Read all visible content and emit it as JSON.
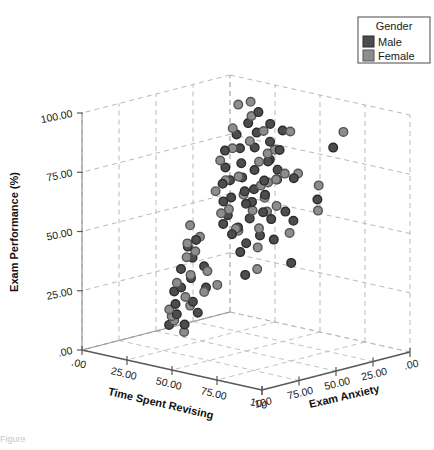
{
  "figure": {
    "caption_partial": "Figure"
  },
  "legend": {
    "title": "Gender",
    "entries": [
      {
        "label": "Male",
        "color": "#4d4d4d"
      },
      {
        "label": "Female",
        "color": "#8d8d8d"
      }
    ]
  },
  "chart_data": {
    "type": "scatter",
    "projection": "3d",
    "title": "",
    "xlabel": "Time Spent Revising",
    "ylabel": "Exam Performance (%)",
    "zlabel": "Exam Anxiety",
    "xlim": [
      0,
      100
    ],
    "ylim": [
      0,
      100
    ],
    "zlim": [
      0,
      100
    ],
    "xticklabels": [
      ".00",
      "25.00",
      "50.00",
      "75.00",
      "100"
    ],
    "xticks": [
      0,
      25,
      50,
      75,
      100
    ],
    "yticklabels": [
      ".00",
      "25.00",
      "50.00",
      "75.00",
      "100.00"
    ],
    "yticks": [
      0,
      25,
      50,
      75,
      100
    ],
    "zticklabels": [
      "100",
      "75.00",
      "50.00",
      "25.00",
      ".00"
    ],
    "zticks": [
      100,
      75,
      50,
      25,
      0
    ],
    "zaxis_reversed": true,
    "grid": true,
    "legend_position": "upper right",
    "series": [
      {
        "name": "Male",
        "color": "#4d4d4d",
        "points": [
          [
            12,
            73,
            18
          ],
          [
            14,
            60,
            22
          ],
          [
            16,
            80,
            15
          ],
          [
            18,
            68,
            25
          ],
          [
            20,
            85,
            12
          ],
          [
            21,
            55,
            30
          ],
          [
            22,
            76,
            20
          ],
          [
            23,
            64,
            28
          ],
          [
            24,
            90,
            10
          ],
          [
            25,
            47,
            35
          ],
          [
            26,
            71,
            24
          ],
          [
            27,
            58,
            32
          ],
          [
            28,
            83,
            16
          ],
          [
            29,
            66,
            27
          ],
          [
            30,
            52,
            38
          ],
          [
            31,
            78,
            21
          ],
          [
            32,
            61,
            29
          ],
          [
            33,
            87,
            13
          ],
          [
            34,
            45,
            40
          ],
          [
            35,
            70,
            26
          ],
          [
            36,
            57,
            33
          ],
          [
            37,
            81,
            18
          ],
          [
            38,
            63,
            30
          ],
          [
            39,
            49,
            42
          ],
          [
            40,
            74,
            23
          ],
          [
            41,
            59,
            35
          ],
          [
            42,
            67,
            28
          ],
          [
            43,
            53,
            39
          ],
          [
            44,
            79,
            20
          ],
          [
            45,
            62,
            31
          ],
          [
            46,
            44,
            45
          ],
          [
            47,
            72,
            25
          ],
          [
            48,
            56,
            36
          ],
          [
            50,
            69,
            29
          ],
          [
            52,
            48,
            43
          ],
          [
            16,
            38,
            48
          ],
          [
            18,
            30,
            55
          ],
          [
            20,
            22,
            62
          ],
          [
            22,
            35,
            52
          ],
          [
            24,
            18,
            66
          ],
          [
            26,
            28,
            58
          ],
          [
            28,
            15,
            70
          ],
          [
            30,
            33,
            54
          ],
          [
            32,
            20,
            64
          ],
          [
            34,
            12,
            72
          ],
          [
            36,
            26,
            60
          ],
          [
            38,
            17,
            68
          ],
          [
            19,
            41,
            46
          ],
          [
            23,
            24,
            61
          ],
          [
            27,
            11,
            74
          ],
          [
            58,
            92,
            35
          ],
          [
            64,
            58,
            50
          ],
          [
            70,
            75,
            42
          ],
          [
            76,
            64,
            55
          ],
          [
            82,
            88,
            30
          ],
          [
            88,
            70,
            48
          ],
          [
            60,
            46,
            66
          ],
          [
            72,
            52,
            58
          ],
          [
            55,
            80,
            40
          ],
          [
            66,
            38,
            70
          ],
          [
            78,
            60,
            52
          ],
          [
            85,
            45,
            62
          ]
        ]
      },
      {
        "name": "Female",
        "color": "#8d8d8d",
        "points": [
          [
            11,
            69,
            20
          ],
          [
            13,
            82,
            14
          ],
          [
            15,
            58,
            28
          ],
          [
            17,
            75,
            19
          ],
          [
            19,
            63,
            26
          ],
          [
            21,
            88,
            11
          ],
          [
            23,
            51,
            34
          ],
          [
            25,
            79,
            17
          ],
          [
            27,
            66,
            27
          ],
          [
            29,
            54,
            36
          ],
          [
            31,
            84,
            15
          ],
          [
            33,
            60,
            31
          ],
          [
            35,
            73,
            23
          ],
          [
            37,
            48,
            41
          ],
          [
            39,
            77,
            22
          ],
          [
            41,
            65,
            29
          ],
          [
            43,
            56,
            37
          ],
          [
            45,
            86,
            14
          ],
          [
            47,
            68,
            26
          ],
          [
            49,
            50,
            40
          ],
          [
            51,
            71,
            25
          ],
          [
            53,
            59,
            33
          ],
          [
            12,
            91,
            9
          ],
          [
            14,
            46,
            44
          ],
          [
            18,
            93,
            8
          ],
          [
            22,
            43,
            47
          ],
          [
            17,
            34,
            50
          ],
          [
            19,
            25,
            59
          ],
          [
            21,
            37,
            49
          ],
          [
            23,
            16,
            69
          ],
          [
            25,
            29,
            57
          ],
          [
            27,
            21,
            63
          ],
          [
            29,
            13,
            73
          ],
          [
            31,
            31,
            53
          ],
          [
            33,
            19,
            67
          ],
          [
            35,
            24,
            60
          ],
          [
            37,
            10,
            76
          ],
          [
            39,
            27,
            56
          ],
          [
            15,
            39,
            47
          ],
          [
            26,
            14,
            71
          ],
          [
            56,
            84,
            38
          ],
          [
            62,
            67,
            52
          ],
          [
            68,
            49,
            64
          ],
          [
            74,
            78,
            44
          ],
          [
            80,
            56,
            57
          ],
          [
            86,
            95,
            28
          ],
          [
            59,
            72,
            46
          ],
          [
            71,
            41,
            68
          ],
          [
            65,
            62,
            54
          ],
          [
            90,
            66,
            50
          ],
          [
            54,
            53,
            60
          ],
          [
            83,
            74,
            41
          ]
        ]
      }
    ]
  }
}
